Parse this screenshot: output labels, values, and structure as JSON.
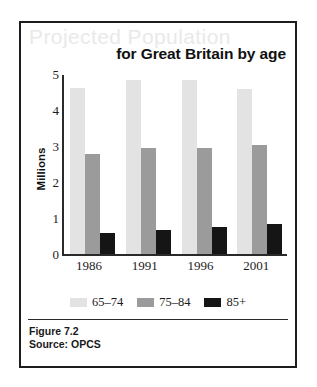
{
  "figure": {
    "title_ghost": "Projected Population",
    "title_main": "for Great Britain by age",
    "caption": "Figure 7.2",
    "source": "Source: OPCS"
  },
  "colors": {
    "series_65_74": "#e3e3e3",
    "series_75_84": "#9b9b9b",
    "series_85_plus": "#151515",
    "axis": "#2a2a2a",
    "frame": "#1d1d1d",
    "ghost_title": "#e9e9e9"
  },
  "chart_data": {
    "type": "bar",
    "title": "Projected Population for Great Britain by age",
    "xlabel": "",
    "ylabel": "Millions",
    "ylim": [
      0,
      5
    ],
    "yticks": [
      5,
      4,
      3,
      2,
      1,
      0
    ],
    "grid": false,
    "legend_position": "bottom",
    "categories": [
      "1986",
      "1991",
      "1996",
      "2001"
    ],
    "series": [
      {
        "name": "65–74",
        "color": "#e3e3e3",
        "values": [
          4.65,
          4.85,
          4.85,
          4.6
        ]
      },
      {
        "name": "75–84",
        "color": "#9b9b9b",
        "values": [
          2.8,
          2.95,
          2.95,
          3.05
        ]
      },
      {
        "name": "85+",
        "color": "#151515",
        "values": [
          0.6,
          0.68,
          0.75,
          0.85
        ]
      }
    ]
  }
}
